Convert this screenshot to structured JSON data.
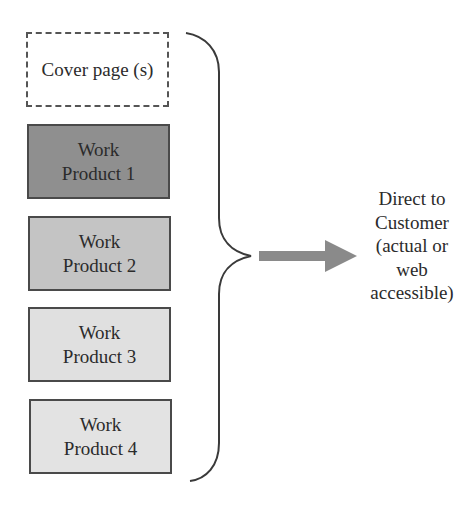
{
  "diagram": {
    "items": [
      {
        "id": "cover",
        "lines": [
          "Cover page (s)"
        ],
        "style": "dashed",
        "fill": "#ffffff",
        "x": 26,
        "y": 32,
        "w": 143,
        "h": 75
      },
      {
        "id": "wp1",
        "lines": [
          "Work",
          "Product 1"
        ],
        "style": "solid",
        "fill": "#8f8f8f",
        "x": 27,
        "y": 124,
        "w": 143,
        "h": 75
      },
      {
        "id": "wp2",
        "lines": [
          "Work",
          "Product 2"
        ],
        "style": "solid",
        "fill": "#c4c4c4",
        "x": 28,
        "y": 216,
        "w": 143,
        "h": 75
      },
      {
        "id": "wp3",
        "lines": [
          "Work",
          "Product 3"
        ],
        "style": "solid",
        "fill": "#e0e0e0",
        "x": 28,
        "y": 307,
        "w": 143,
        "h": 75
      },
      {
        "id": "wp4",
        "lines": [
          "Work",
          "Product 4"
        ],
        "style": "solid",
        "fill": "#e3e3e3",
        "x": 29,
        "y": 399,
        "w": 143,
        "h": 75
      }
    ],
    "brace": {
      "color": "#3a3a3a",
      "top": 33,
      "bottom": 481,
      "tip_x": 251,
      "tip_y": 256,
      "line_x": 219
    },
    "arrow": {
      "color": "#8a8a8a",
      "x_start": 259,
      "x_end": 357,
      "y": 256
    },
    "destination": {
      "lines": [
        "Direct to",
        "Customer",
        "(actual or",
        "web",
        "accessible)"
      ]
    }
  }
}
